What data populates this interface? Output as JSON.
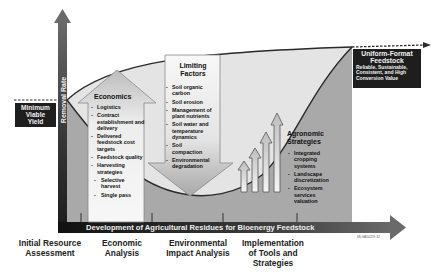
{
  "axis": {
    "y_label": "Removal Rate",
    "x_label": "Development of Agricultural Residues for Bioenergy Feedstock"
  },
  "minimum_yield": {
    "label_lines": [
      "Minimum",
      "Viable",
      "Yield"
    ]
  },
  "uniform_feedstock": {
    "title_lines": [
      "Uniform-Format",
      "Feedstock"
    ],
    "subtitle_lines": [
      "Reliable, Sustainable,",
      "Consistent, and High",
      "Conversion Value"
    ]
  },
  "economics": {
    "title": "Economics",
    "items": [
      "Logistics",
      "Contract establishment and delivery",
      "Delivered feedstock cost targets",
      "Feedstock quality",
      "Harvesting strategies"
    ],
    "sub_items": [
      "Selective harvest",
      "Single pass"
    ]
  },
  "limiting_factors": {
    "title_lines": [
      "Limiting",
      "Factors"
    ],
    "items": [
      "Soil organic carbon",
      "Soil erosion",
      "Management of plant nutrients",
      "Soil water and temperature dynamics",
      "Soil compaction",
      "Environmental degradation"
    ]
  },
  "agronomic": {
    "title_lines": [
      "Agronomic",
      "Strategies"
    ],
    "items": [
      "Integrated cropping systems",
      "Landscape discretization",
      "Ecosystem services valuation"
    ]
  },
  "stages": [
    {
      "lines": [
        "Initial Resource",
        "Assessment"
      ]
    },
    {
      "lines": [
        "Economic",
        "Analysis"
      ]
    },
    {
      "lines": [
        "Environmental",
        "Impact Analysis"
      ]
    },
    {
      "lines": [
        "Implementation",
        "of Tools and",
        "Strategies"
      ]
    }
  ],
  "figure_code": "08-GA50259-32",
  "colors": {
    "axis_dark": "#3a3a3a",
    "panel_gray": "#a9a9a9",
    "panel_light": "#e6e6e6",
    "box_dark": "#1e1e1e"
  }
}
